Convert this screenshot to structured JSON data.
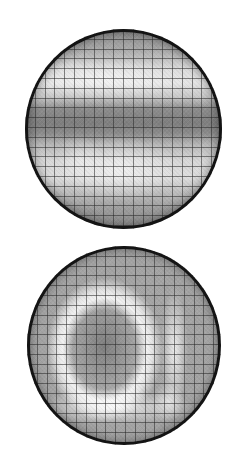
{
  "figure": {
    "panels": [
      {
        "id": "wafer-map-1",
        "shape": "circle",
        "grid": {
          "cells_across": 20,
          "cell_size_px": 10
        },
        "pattern": "horizontal bands: bright band upper third, dark band at center, bright region lower half, darker rim",
        "colors": {
          "bright": "#e6e6e6",
          "dark": "#7e7e7e",
          "rim": "#141414",
          "gridline": "#3a3a3a"
        }
      },
      {
        "id": "wafer-map-2",
        "shape": "circle",
        "grid": {
          "cells_across": 20,
          "cell_size_px": 10
        },
        "pattern": "bright horseshoe ring around dark center-left core, bright vertical stripe on right",
        "colors": {
          "bright": "#f0f0f0",
          "dark": "#7a7a7a",
          "rim": "#141414",
          "gridline": "#3a3a3a"
        }
      }
    ],
    "background": "#ffffff"
  }
}
